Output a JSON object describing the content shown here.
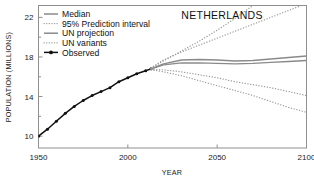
{
  "chart_data": {
    "type": "line",
    "title": "NETHERLANDS",
    "xlabel": "YEAR",
    "ylabel": "POPULATION (MILLIONS)",
    "xlim": [
      1950,
      2100
    ],
    "ylim": [
      8.8,
      23.2
    ],
    "xticks": [
      1950,
      2000,
      2050,
      2100
    ],
    "xtick_labels": [
      "1950",
      "2000",
      "2050",
      "2100"
    ],
    "yticks": [
      10,
      14,
      18,
      22
    ],
    "ytick_labels": [
      "10",
      "14",
      "18",
      "22"
    ],
    "yticks_minor": [
      12,
      16,
      20
    ],
    "grid": false,
    "legend_position": "top-left",
    "series": [
      {
        "name": "Observed",
        "style": "solid-with-markers",
        "color": "#111111",
        "x": [
          1950,
          1955,
          1960,
          1965,
          1970,
          1975,
          1980,
          1985,
          1990,
          1995,
          2000,
          2005,
          2010,
          2013
        ],
        "values": [
          10.0,
          10.7,
          11.5,
          12.3,
          13.0,
          13.6,
          14.1,
          14.5,
          14.9,
          15.5,
          15.9,
          16.3,
          16.6,
          16.8
        ]
      },
      {
        "name": "Median",
        "style": "solid",
        "color": "#8a8a8a",
        "x": [
          2013,
          2020,
          2030,
          2040,
          2050,
          2060,
          2070,
          2080,
          2090,
          2100
        ],
        "values": [
          16.8,
          17.2,
          17.4,
          17.4,
          17.35,
          17.3,
          17.35,
          17.45,
          17.55,
          17.65
        ]
      },
      {
        "name": "UN projection",
        "style": "solid",
        "color": "#8a8a8a",
        "x": [
          2013,
          2020,
          2030,
          2040,
          2050,
          2060,
          2070,
          2080,
          2090,
          2100
        ],
        "values": [
          16.8,
          17.3,
          17.7,
          17.75,
          17.7,
          17.6,
          17.65,
          17.8,
          17.95,
          18.1
        ]
      },
      {
        "name": "95% Prediction interval upper",
        "style": "dotted",
        "color": "#9a9a9a",
        "x": [
          2013,
          2020,
          2030,
          2040,
          2050,
          2060,
          2070,
          2080,
          2090,
          2100
        ],
        "values": [
          16.9,
          17.7,
          18.5,
          19.2,
          19.9,
          20.6,
          21.3,
          22.0,
          22.7,
          23.4
        ]
      },
      {
        "name": "95% Prediction interval lower",
        "style": "dotted",
        "color": "#9a9a9a",
        "x": [
          2013,
          2020,
          2030,
          2040,
          2050,
          2060,
          2070,
          2080,
          2090,
          2100
        ],
        "values": [
          16.7,
          16.5,
          16.1,
          15.6,
          15.1,
          14.6,
          14.1,
          13.5,
          12.9,
          12.4
        ]
      },
      {
        "name": "UN variants high",
        "style": "dotted",
        "color": "#9a9a9a",
        "x": [
          2013,
          2020,
          2030,
          2040,
          2050,
          2060,
          2070,
          2080,
          2090,
          2100
        ],
        "values": [
          16.85,
          17.6,
          18.6,
          19.6,
          20.7,
          21.9,
          23.2,
          24.6,
          26.0,
          27.5
        ]
      },
      {
        "name": "UN variants low",
        "style": "dotted",
        "color": "#9a9a9a",
        "x": [
          2013,
          2020,
          2030,
          2040,
          2050,
          2060,
          2070,
          2080,
          2090,
          2100
        ],
        "values": [
          16.75,
          16.7,
          16.5,
          16.2,
          15.9,
          15.5,
          15.2,
          14.9,
          14.5,
          14.1
        ]
      }
    ]
  },
  "legend": {
    "items": [
      {
        "label": "Median",
        "marker": "solid-line",
        "color": "#8a8a8a"
      },
      {
        "label": "95% Prediction interval",
        "marker": "dotted-line",
        "color": "#9a9a9a"
      },
      {
        "label": "UN projection",
        "marker": "solid-line",
        "color": "#8a8a8a"
      },
      {
        "label": "UN variants",
        "marker": "dotted-line",
        "color": "#9a9a9a"
      },
      {
        "label": "Observed",
        "marker": "line-with-dot",
        "color": "#111111"
      }
    ]
  }
}
